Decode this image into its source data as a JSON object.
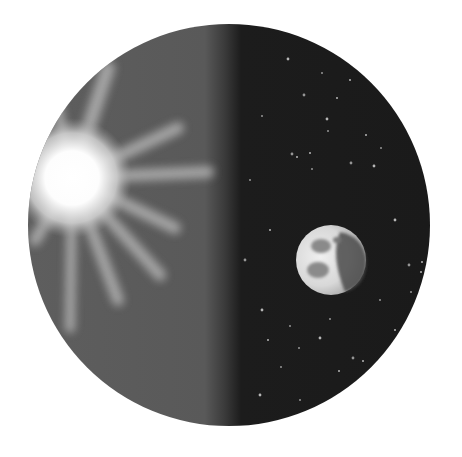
{
  "illustration": {
    "subject": "Sun and moon in a circular frame, day side and night side",
    "frame": {
      "cx": 229,
      "cy": 225,
      "r": 201
    },
    "colors": {
      "background": "#ffffff",
      "day_side": "#5e5e5e",
      "night_side": "#1a1a1a",
      "sun_core": "#ffffff",
      "sun_ray": "#bdbdbd",
      "star": "#bfbfbf",
      "moon_light": "#e6e6e6",
      "moon_shadow": "#4a4a4a",
      "moon_maria": "#8a8a8a"
    },
    "terminator_x": 225,
    "sun": {
      "cx": 72,
      "cy": 178,
      "core_r": 38,
      "rays": [
        {
          "x2": 108,
          "y2": 68,
          "w": 14
        },
        {
          "x2": 178,
          "y2": 128,
          "w": 12
        },
        {
          "x2": 208,
          "y2": 172,
          "w": 12
        },
        {
          "x2": 175,
          "y2": 228,
          "w": 12
        },
        {
          "x2": 160,
          "y2": 275,
          "w": 12
        },
        {
          "x2": 118,
          "y2": 300,
          "w": 12
        },
        {
          "x2": 70,
          "y2": 328,
          "w": 10
        },
        {
          "x2": 35,
          "y2": 240,
          "w": 12
        },
        {
          "x2": 55,
          "y2": 95,
          "w": 10
        }
      ]
    },
    "moon": {
      "cx": 331,
      "cy": 260,
      "r": 35
    },
    "stars": [
      [
        288,
        59
      ],
      [
        322,
        73
      ],
      [
        350,
        80
      ],
      [
        304,
        95
      ],
      [
        337,
        98
      ],
      [
        262,
        116
      ],
      [
        327,
        119
      ],
      [
        328,
        131
      ],
      [
        297,
        157
      ],
      [
        292,
        154
      ],
      [
        310,
        153
      ],
      [
        312,
        169
      ],
      [
        374,
        166
      ],
      [
        381,
        148
      ],
      [
        366,
        135
      ],
      [
        351,
        163
      ],
      [
        268,
        340
      ],
      [
        299,
        348
      ],
      [
        320,
        338
      ],
      [
        281,
        367
      ],
      [
        339,
        371
      ],
      [
        353,
        358
      ],
      [
        363,
        361
      ],
      [
        330,
        319
      ],
      [
        262,
        310
      ],
      [
        290,
        326
      ],
      [
        422,
        262
      ],
      [
        409,
        265
      ],
      [
        421,
        272
      ],
      [
        411,
        292
      ],
      [
        395,
        220
      ],
      [
        250,
        180
      ],
      [
        270,
        230
      ],
      [
        245,
        260
      ],
      [
        395,
        330
      ],
      [
        380,
        300
      ],
      [
        260,
        395
      ],
      [
        300,
        400
      ],
      [
        345,
        395
      ]
    ]
  }
}
